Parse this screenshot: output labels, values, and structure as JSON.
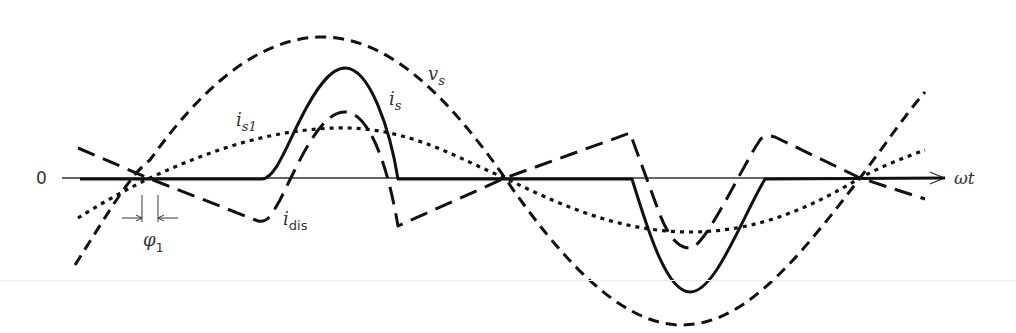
{
  "figure": {
    "type": "waveform-diagram",
    "axis": {
      "origin_label": "0",
      "x_label": "ωt",
      "y_axis_y": 178
    },
    "labels": {
      "vs": {
        "main": "v",
        "sub": "s"
      },
      "is": {
        "main": "i",
        "sub": "s"
      },
      "is1": {
        "main": "i",
        "sub": "s1"
      },
      "idis": {
        "main": "i",
        "sub": "dis"
      },
      "phi1": {
        "main": "φ",
        "sub": "1"
      }
    },
    "curves": [
      {
        "name": "v_s",
        "description": "supply voltage (sinusoid)",
        "style": "dashed"
      },
      {
        "name": "i_s",
        "description": "supply current (pulsed)",
        "style": "solid"
      },
      {
        "name": "i_s1",
        "description": "fundamental component of supply current",
        "style": "dotted"
      },
      {
        "name": "i_dis",
        "description": "distortion component of current",
        "style": "long-dashed"
      }
    ],
    "annotation": "φ1 = phase displacement between v_s and i_s1",
    "colors": {
      "stroke": "#111111",
      "text": "#333333",
      "background": "#ffffff"
    }
  }
}
